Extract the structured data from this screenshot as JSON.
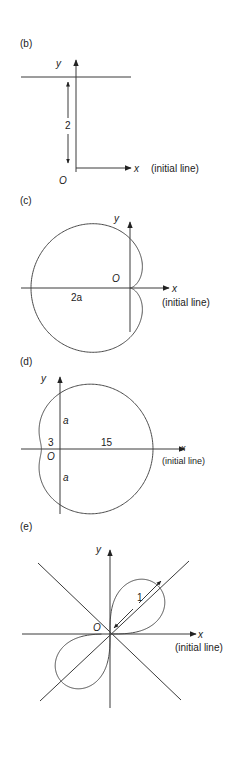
{
  "panels": [
    {
      "id": "b",
      "label": "(b)",
      "axis_x": "x",
      "axis_y": "y",
      "origin": "O",
      "initial_line": "(initial line)",
      "dimension": "2",
      "description": "Horizontal line r sin θ = 2, parallel to the initial line at distance 2"
    },
    {
      "id": "c",
      "label": "(c)",
      "axis_x": "x",
      "axis_y": "y",
      "origin": "O",
      "initial_line": "(initial line)",
      "dimension": "2a",
      "description": "Cardioid r = a(1 − cos θ)"
    },
    {
      "id": "d",
      "label": "(d)",
      "axis_x": "x",
      "axis_y": "y",
      "origin": "O",
      "initial_line": "(initial line)",
      "dimension_left": "3",
      "dimension_right": "15",
      "dimension_top": "a",
      "dimension_bottom": "a",
      "description": "Limaçon r = 9 + 6 cos θ"
    },
    {
      "id": "e",
      "label": "(e)",
      "axis_x": "x",
      "axis_y": "y",
      "origin": "O",
      "initial_line": "(initial line)",
      "dimension": "1",
      "description": "Lemniscate r² = sin 2θ with tangent lines y = ±x at the pole"
    }
  ]
}
